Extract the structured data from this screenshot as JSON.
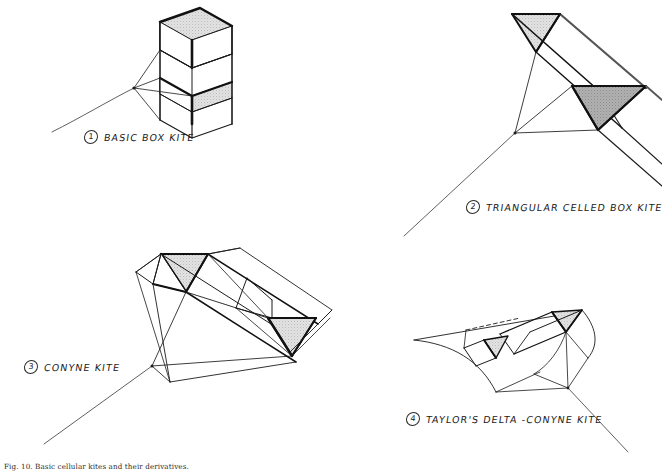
{
  "page": {
    "background_color": "#ffffff",
    "ink_color": "#1b1b1b",
    "shade_light": "#dcdcdc",
    "shade_dark": "#a9a9a9",
    "width": 662,
    "height": 474
  },
  "figures": [
    {
      "number": "1",
      "label": "BASIC BOX KITE",
      "name": "basic-box-kite"
    },
    {
      "number": "2",
      "label": "TRIANGULAR CELLED BOX KITE",
      "name": "triangular-celled-box-kite"
    },
    {
      "number": "3",
      "label": "CONYNE KITE",
      "name": "conyne-kite"
    },
    {
      "number": "4",
      "label": "TAYLOR'S DELTA -CONYNE KITE",
      "name": "taylors-delta-conyne-kite"
    }
  ],
  "footer": {
    "caption": "Fig. 10. Basic cellular kites and their derivatives."
  }
}
